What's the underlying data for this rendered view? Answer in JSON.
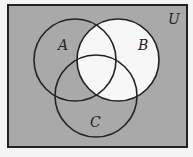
{
  "diagram": {
    "type": "venn",
    "universe_label": "U",
    "sets": [
      {
        "name": "A",
        "cx": 75,
        "cy": 60,
        "r": 41,
        "label_x": 58,
        "label_y": 50
      },
      {
        "name": "B",
        "cx": 118,
        "cy": 60,
        "r": 41,
        "label_x": 138,
        "label_y": 50
      },
      {
        "name": "C",
        "cx": 96,
        "cy": 96,
        "r": 41,
        "label_x": 90,
        "label_y": 127
      }
    ],
    "shaded_region": "complement of B (U \\ B)",
    "colors": {
      "shade": "#a9a9a9",
      "unshaded": "#f7f7f7",
      "stroke": "#222222",
      "background": "#f4f4f4"
    },
    "frame": {
      "x": 8,
      "y": 5,
      "width": 179,
      "height": 142
    }
  }
}
